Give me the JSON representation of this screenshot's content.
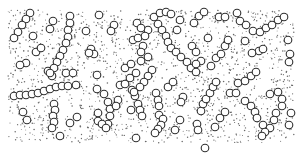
{
  "figure": {
    "title": "Particle chain stipple illustration",
    "background": "#ffffff",
    "dot_color": "#6a6a6a",
    "circle_stroke": "#2e2e2e",
    "circle_fill": "#ffffff",
    "region": {
      "x": 8,
      "y": 10,
      "width": 286,
      "height": 133
    },
    "circle_radius": 3.8,
    "dot_count": 1700,
    "circles": [
      [
        30,
        13
      ],
      [
        26,
        19
      ],
      [
        22,
        25
      ],
      [
        18,
        32
      ],
      [
        14,
        38
      ],
      [
        53,
        21
      ],
      [
        50,
        29
      ],
      [
        33,
        36
      ],
      [
        36,
        52
      ],
      [
        41,
        48
      ],
      [
        26,
        63
      ],
      [
        20,
        65
      ],
      [
        48,
        71
      ],
      [
        52,
        76
      ],
      [
        70,
        16
      ],
      [
        70,
        23
      ],
      [
        68,
        30
      ],
      [
        68,
        37
      ],
      [
        66,
        43
      ],
      [
        63,
        50
      ],
      [
        60,
        56
      ],
      [
        57,
        62
      ],
      [
        54,
        68
      ],
      [
        50,
        73
      ],
      [
        86,
        31
      ],
      [
        91,
        49
      ],
      [
        94,
        54
      ],
      [
        89,
        53
      ],
      [
        97,
        75
      ],
      [
        66,
        73
      ],
      [
        73,
        73
      ],
      [
        99,
        15
      ],
      [
        114,
        25
      ],
      [
        111,
        31
      ],
      [
        137,
        23
      ],
      [
        133,
        40
      ],
      [
        138,
        38
      ],
      [
        143,
        46
      ],
      [
        141,
        52
      ],
      [
        141,
        61
      ],
      [
        148,
        57
      ],
      [
        125,
        68
      ],
      [
        131,
        64
      ],
      [
        148,
        30
      ],
      [
        145,
        36
      ],
      [
        141,
        28
      ],
      [
        154,
        17
      ],
      [
        160,
        13
      ],
      [
        166,
        12
      ],
      [
        171,
        14
      ],
      [
        180,
        20
      ],
      [
        158,
        24
      ],
      [
        162,
        30
      ],
      [
        166,
        36
      ],
      [
        168,
        42
      ],
      [
        171,
        48
      ],
      [
        176,
        52
      ],
      [
        181,
        57
      ],
      [
        187,
        62
      ],
      [
        191,
        68
      ],
      [
        196,
        72
      ],
      [
        177,
        30
      ],
      [
        208,
        38
      ],
      [
        219,
        17
      ],
      [
        225,
        17
      ],
      [
        237,
        13
      ],
      [
        240,
        21
      ],
      [
        246,
        25
      ],
      [
        253,
        31
      ],
      [
        260,
        32
      ],
      [
        266,
        28
      ],
      [
        272,
        25
      ],
      [
        278,
        20
      ],
      [
        284,
        17
      ],
      [
        245,
        41
      ],
      [
        259,
        51
      ],
      [
        263,
        49
      ],
      [
        252,
        53
      ],
      [
        194,
        23
      ],
      [
        199,
        16
      ],
      [
        204,
        12
      ],
      [
        288,
        40
      ],
      [
        290,
        54
      ],
      [
        289,
        62
      ],
      [
        132,
        90
      ],
      [
        135,
        96
      ],
      [
        138,
        104
      ],
      [
        140,
        110
      ],
      [
        142,
        116
      ],
      [
        192,
        46
      ],
      [
        196,
        52
      ],
      [
        201,
        61
      ],
      [
        196,
        64
      ],
      [
        211,
        66
      ],
      [
        216,
        58
      ],
      [
        221,
        54
      ],
      [
        225,
        46
      ],
      [
        228,
        40
      ],
      [
        152,
        70
      ],
      [
        148,
        76
      ],
      [
        144,
        82
      ],
      [
        140,
        87
      ],
      [
        134,
        92
      ],
      [
        14,
        96
      ],
      [
        20,
        95
      ],
      [
        26,
        95
      ],
      [
        32,
        94
      ],
      [
        38,
        93
      ],
      [
        44,
        91
      ],
      [
        50,
        89
      ],
      [
        56,
        87
      ],
      [
        62,
        86
      ],
      [
        68,
        86
      ],
      [
        76,
        85
      ],
      [
        54,
        104
      ],
      [
        55,
        110
      ],
      [
        53,
        116
      ],
      [
        54,
        122
      ],
      [
        52,
        128
      ],
      [
        23,
        112
      ],
      [
        27,
        120
      ],
      [
        77,
        117
      ],
      [
        70,
        123
      ],
      [
        60,
        136
      ],
      [
        97,
        89
      ],
      [
        104,
        94
      ],
      [
        108,
        102
      ],
      [
        110,
        109
      ],
      [
        110,
        116
      ],
      [
        108,
        124
      ],
      [
        98,
        113
      ],
      [
        98,
        121
      ],
      [
        102,
        124
      ],
      [
        106,
        128
      ],
      [
        120,
        85
      ],
      [
        118,
        100
      ],
      [
        116,
        106
      ],
      [
        125,
        84
      ],
      [
        130,
        78
      ],
      [
        136,
        73
      ],
      [
        131,
        110
      ],
      [
        136,
        138
      ],
      [
        156,
        93
      ],
      [
        158,
        100
      ],
      [
        159,
        106
      ],
      [
        159,
        115
      ],
      [
        168,
        87
      ],
      [
        173,
        82
      ],
      [
        183,
        97
      ],
      [
        181,
        102
      ],
      [
        201,
        111
      ],
      [
        203,
        104
      ],
      [
        206,
        99
      ],
      [
        210,
        93
      ],
      [
        213,
        87
      ],
      [
        216,
        82
      ],
      [
        230,
        93
      ],
      [
        236,
        93
      ],
      [
        238,
        83
      ],
      [
        245,
        81
      ],
      [
        251,
        76
      ],
      [
        256,
        72
      ],
      [
        245,
        101
      ],
      [
        251,
        106
      ],
      [
        255,
        112
      ],
      [
        257,
        118
      ],
      [
        163,
        119
      ],
      [
        161,
        125
      ],
      [
        158,
        129
      ],
      [
        155,
        133
      ],
      [
        175,
        130
      ],
      [
        180,
        120
      ],
      [
        197,
        124
      ],
      [
        198,
        130
      ],
      [
        215,
        127
      ],
      [
        220,
        118
      ],
      [
        225,
        112
      ],
      [
        205,
        148
      ],
      [
        270,
        94
      ],
      [
        278,
        92
      ],
      [
        282,
        99
      ],
      [
        282,
        106
      ],
      [
        276,
        113
      ],
      [
        274,
        120
      ],
      [
        263,
        125
      ],
      [
        270,
        128
      ],
      [
        265,
        132
      ],
      [
        262,
        136
      ],
      [
        291,
        113
      ],
      [
        289,
        125
      ]
    ]
  }
}
